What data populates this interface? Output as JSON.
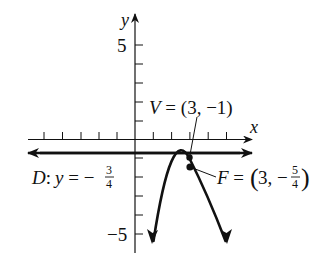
{
  "figure": {
    "type": "parabola-graph",
    "axes": {
      "x_label": "x",
      "y_label": "y",
      "y_tick_labels": {
        "top": "5",
        "bottom": "−5"
      },
      "x_range": [
        -5,
        6
      ],
      "y_range": [
        -5,
        6
      ],
      "x_ticks_negative": [
        -5,
        -4,
        -3,
        -2,
        -1
      ],
      "x_ticks_positive": [
        1,
        2,
        3,
        4,
        5
      ],
      "y_ticks": [
        5,
        4,
        3,
        2,
        1,
        -1,
        -2,
        -3,
        -4,
        -5
      ]
    },
    "vertex": {
      "label_prefix": "V",
      "label_eq": " = (3, −1)",
      "point": [
        3,
        -1
      ]
    },
    "focus": {
      "label_prefix": "F",
      "label_eq": " = ",
      "paren_open": "(",
      "x_value": "3, −",
      "frac_num": "5",
      "frac_den": "4",
      "paren_close": ")",
      "point": [
        3,
        -1.25
      ]
    },
    "directrix": {
      "label_prefix": "D",
      "label_colon": ":",
      "label_var": "y",
      "label_eq": " = −",
      "frac_num": "3",
      "frac_den": "4",
      "y_value": -0.75
    },
    "curve": {
      "equation": "(x-3)^2 = -(y+1)",
      "opens": "down"
    },
    "colors": {
      "stroke": "#111111",
      "background": "#ffffff"
    }
  }
}
